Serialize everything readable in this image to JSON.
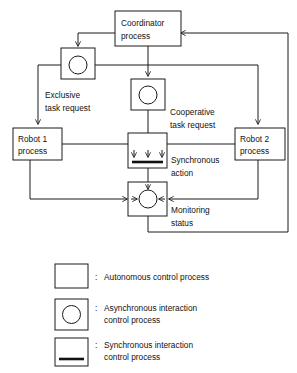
{
  "diagram": {
    "nodes": [
      {
        "id": "coordinator",
        "type": "autonomous-control-process",
        "line1": "Coordinator",
        "line2": "process"
      },
      {
        "id": "robot1",
        "type": "autonomous-control-process",
        "line1": "Robot 1",
        "line2": "process"
      },
      {
        "id": "robot2",
        "type": "autonomous-control-process",
        "line1": "Robot 2",
        "line2": "process"
      },
      {
        "id": "exclusive-async",
        "type": "asynchronous-interaction-control-process",
        "line1": "",
        "line2": ""
      },
      {
        "id": "cooperative-async",
        "type": "asynchronous-interaction-control-process",
        "line1": "",
        "line2": ""
      },
      {
        "id": "synchronous-action",
        "type": "synchronous-interaction-control-process",
        "line1": "",
        "line2": ""
      },
      {
        "id": "monitoring-status",
        "type": "asynchronous-interaction-control-process",
        "line1": "",
        "line2": ""
      }
    ],
    "edge_labels": [
      {
        "id": "exclusive-task-request",
        "line1": "Exclusive",
        "line2": "task request"
      },
      {
        "id": "cooperative-task-request",
        "line1": "Cooperative",
        "line2": "task request"
      },
      {
        "id": "synchronous-action",
        "line1": "Synchronous",
        "line2": "action"
      },
      {
        "id": "monitoring-status",
        "line1": "Monitoring",
        "line2": "status"
      }
    ]
  },
  "legend": {
    "separator": ":",
    "items": [
      {
        "symbol": "empty-box",
        "line1": "Autonomous control process",
        "line2": ""
      },
      {
        "symbol": "box-with-circle",
        "line1": "Asynchronous interaction",
        "line2": "control process"
      },
      {
        "symbol": "box-with-bar",
        "line1": "Synchronous interaction",
        "line2": "control process"
      }
    ]
  },
  "colors": {
    "stroke": "#1a1a1a",
    "background": "#ffffff",
    "text": "#111111"
  }
}
